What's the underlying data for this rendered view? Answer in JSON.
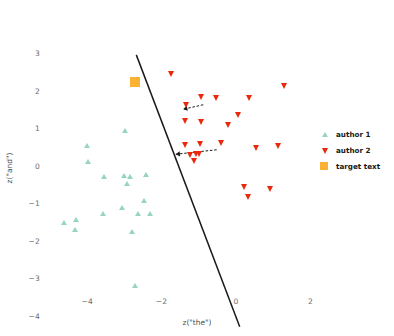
{
  "chart_data": {
    "type": "scatter",
    "title": "",
    "xlabel": "z(\"the\")",
    "ylabel": "z(\"and\")",
    "xlim": [
      -5.4,
      2.7
    ],
    "ylim": [
      -4.4,
      3.3
    ],
    "xticks": [
      -4,
      -2,
      0,
      2
    ],
    "xticklabels": [
      "−4",
      "−2",
      "0",
      "2"
    ],
    "yticks": [
      3,
      2,
      1,
      0,
      -1,
      -2,
      -3,
      -4
    ],
    "yticklabels": [
      "3",
      "2",
      "1",
      "0",
      "−1",
      "−2",
      "−3",
      "−4"
    ],
    "grid": false,
    "legend_position": "right",
    "colors": {
      "author1": "#97d4c4",
      "author2": "#e8290b",
      "target": "#f9b233",
      "boundary": "#1a1a1a",
      "arrow": "#1a1a1a"
    },
    "series": [
      {
        "name": "author 1",
        "marker": "triangle-up",
        "color": "#97d4c4",
        "points": [
          [
            -2.98,
            0.92
          ],
          [
            -4.0,
            0.52
          ],
          [
            -3.97,
            0.1
          ],
          [
            -3.55,
            -0.3
          ],
          [
            -3.02,
            -0.29
          ],
          [
            -2.86,
            -0.3
          ],
          [
            -2.42,
            -0.26
          ],
          [
            -2.92,
            -0.48
          ],
          [
            -3.05,
            -1.12
          ],
          [
            -2.48,
            -0.95
          ],
          [
            -2.62,
            -1.28
          ],
          [
            -2.32,
            -1.3
          ],
          [
            -4.3,
            -1.46
          ],
          [
            -4.62,
            -1.52
          ],
          [
            -4.32,
            -1.72
          ],
          [
            -2.78,
            -1.76
          ],
          [
            -2.7,
            -3.22
          ],
          [
            -3.58,
            -1.3
          ]
        ]
      },
      {
        "name": "author 2",
        "marker": "triangle-down",
        "color": "#e8290b",
        "points": [
          [
            -1.72,
            2.43
          ],
          [
            1.3,
            2.12
          ],
          [
            -0.92,
            1.82
          ],
          [
            -0.52,
            1.8
          ],
          [
            0.36,
            1.8
          ],
          [
            0.08,
            1.36
          ],
          [
            -1.32,
            1.62
          ],
          [
            -1.35,
            1.18
          ],
          [
            -0.92,
            1.15
          ],
          [
            -0.2,
            1.08
          ],
          [
            1.15,
            0.52
          ],
          [
            0.55,
            0.46
          ],
          [
            -1.35,
            0.56
          ],
          [
            -0.95,
            0.58
          ],
          [
            -0.4,
            0.6
          ],
          [
            -1.22,
            0.28
          ],
          [
            -1.05,
            0.3
          ],
          [
            -0.98,
            0.32
          ],
          [
            -1.1,
            0.12
          ],
          [
            0.22,
            -0.58
          ],
          [
            0.92,
            -0.62
          ],
          [
            0.35,
            -0.85
          ]
        ]
      }
    ],
    "target_text": {
      "name": "target text",
      "marker": "square",
      "color": "#f9b233",
      "point": [
        -2.72,
        2.22
      ]
    },
    "decision_boundary": {
      "x1": -2.68,
      "y1": 2.95,
      "x2": 0.1,
      "y2": -4.3
    },
    "annotations": [
      {
        "name": "perturbation-arrow-upper",
        "from": [
          -0.88,
          1.62
        ],
        "to": [
          -1.42,
          1.5
        ]
      },
      {
        "name": "perturbation-arrow-lower",
        "from": [
          -0.52,
          0.42
        ],
        "to": [
          -1.62,
          0.3
        ]
      }
    ]
  },
  "legend": {
    "items": [
      {
        "label": "author 1",
        "marker": "triangle-up",
        "color": "#97d4c4"
      },
      {
        "label": "author 2",
        "marker": "triangle-down",
        "color": "#e8290b"
      },
      {
        "label": "target text",
        "marker": "square",
        "color": "#f9b233"
      }
    ]
  }
}
